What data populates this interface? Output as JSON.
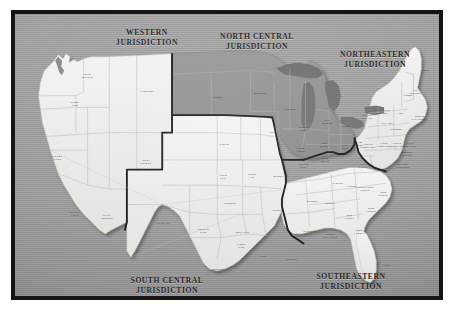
{
  "figure": {
    "kind": "printed-map-plate",
    "frame_color": "#141414",
    "paper_color": "#ffffff"
  },
  "palette": {
    "ocean_gray": "#9a9a9a",
    "land_light": "#ededeb",
    "land_gray": "#8f8f8f",
    "lake_gray": "#70706f",
    "state_line": "#b9b9b6",
    "jurisdiction_line": "#151515",
    "label_ink": "#26241f"
  },
  "jurisdictions": [
    {
      "id": "western",
      "line1": "Western",
      "line2": "Jurisdiction",
      "fill": "light"
    },
    {
      "id": "north-central",
      "line1": "North Central",
      "line2": "Jurisdiction",
      "fill": "gray"
    },
    {
      "id": "northeastern",
      "line1": "Northeastern",
      "line2": "Jurisdiction",
      "fill": "light"
    },
    {
      "id": "south-central",
      "line1": "South Central",
      "line2": "Jurisdiction",
      "fill": "light"
    },
    {
      "id": "southeastern",
      "line1": "Southeastern",
      "line2": "Jurisdiction",
      "fill": "light"
    }
  ],
  "conference_labels": [
    {
      "text": "Pacific\nNorthwest",
      "x": 72,
      "y": 62,
      "shade": "light"
    },
    {
      "text": "Oregon-\nIdaho",
      "x": 60,
      "y": 90,
      "shade": "light"
    },
    {
      "text": "Yellowstone",
      "x": 132,
      "y": 78,
      "shade": "light"
    },
    {
      "text": "Rocky\nMountain",
      "x": 131,
      "y": 148,
      "shade": "light"
    },
    {
      "text": "California-\nNevada",
      "x": 42,
      "y": 144,
      "shade": "light"
    },
    {
      "text": "California-\nPacific",
      "x": 60,
      "y": 200,
      "shade": "light"
    },
    {
      "text": "Desert\nSouthwest",
      "x": 92,
      "y": 203,
      "shade": "light"
    },
    {
      "text": "Dakotas",
      "x": 203,
      "y": 84,
      "shade": "gray"
    },
    {
      "text": "Minnesota",
      "x": 245,
      "y": 80,
      "shade": "gray"
    },
    {
      "text": "Wisconsin",
      "x": 275,
      "y": 96,
      "shade": "gray"
    },
    {
      "text": "Iowa",
      "x": 257,
      "y": 119,
      "shade": "gray"
    },
    {
      "text": "Northern\nIllinois",
      "x": 288,
      "y": 115,
      "shade": "gray"
    },
    {
      "text": "West\nMichigan",
      "x": 312,
      "y": 108,
      "shade": "gray"
    },
    {
      "text": "Detroit",
      "x": 331,
      "y": 113,
      "shade": "gray"
    },
    {
      "text": "North\nIndiana",
      "x": 309,
      "y": 131,
      "shade": "gray"
    },
    {
      "text": "South\nIndiana",
      "x": 310,
      "y": 146,
      "shade": "gray"
    },
    {
      "text": "Central\nIllinois",
      "x": 286,
      "y": 136,
      "shade": "gray"
    },
    {
      "text": "Southern\nIllinois",
      "x": 288,
      "y": 152,
      "shade": "gray"
    },
    {
      "text": "West\nOhio",
      "x": 330,
      "y": 133,
      "shade": "gray"
    },
    {
      "text": "East\nOhio",
      "x": 345,
      "y": 130,
      "shade": "gray"
    },
    {
      "text": "Nebraska",
      "x": 209,
      "y": 131,
      "shade": "light"
    },
    {
      "text": "Kansas\nWest",
      "x": 208,
      "y": 163,
      "shade": "light"
    },
    {
      "text": "Kansas\nEast",
      "x": 237,
      "y": 162,
      "shade": "light"
    },
    {
      "text": "Missouri",
      "x": 263,
      "y": 163,
      "shade": "light"
    },
    {
      "text": "Oklahoma",
      "x": 215,
      "y": 190,
      "shade": "light"
    },
    {
      "text": "Arkansas",
      "x": 262,
      "y": 197,
      "shade": "light"
    },
    {
      "text": "New Mexico",
      "x": 148,
      "y": 210,
      "shade": "light"
    },
    {
      "text": "Northwest\nTexas",
      "x": 188,
      "y": 217,
      "shade": "light"
    },
    {
      "text": "North Texas",
      "x": 227,
      "y": 219,
      "shade": "light"
    },
    {
      "text": "Central\nTexas",
      "x": 226,
      "y": 232,
      "shade": "light"
    },
    {
      "text": "Texas",
      "x": 248,
      "y": 243,
      "shade": "light"
    },
    {
      "text": "Southwest\nTexas",
      "x": 203,
      "y": 257,
      "shade": "light"
    },
    {
      "text": "Louisiana",
      "x": 276,
      "y": 246,
      "shade": "light"
    },
    {
      "text": "Mississippi",
      "x": 295,
      "y": 218,
      "shade": "light"
    },
    {
      "text": "Alabama-\nWest Florida",
      "x": 315,
      "y": 222,
      "shade": "light"
    },
    {
      "text": "Memphis",
      "x": 297,
      "y": 188,
      "shade": "light"
    },
    {
      "text": "Tennessee",
      "x": 315,
      "y": 190,
      "shade": "light"
    },
    {
      "text": "Holston",
      "x": 337,
      "y": 173,
      "shade": "light"
    },
    {
      "text": "Kentucky",
      "x": 323,
      "y": 170,
      "shade": "light"
    },
    {
      "text": "North\nGeorgia",
      "x": 334,
      "y": 203,
      "shade": "light"
    },
    {
      "text": "South\nGeorgia",
      "x": 344,
      "y": 218,
      "shade": "light"
    },
    {
      "text": "North\nCarolina",
      "x": 368,
      "y": 180,
      "shade": "light"
    },
    {
      "text": "Western North\nCarolina",
      "x": 350,
      "y": 175,
      "shade": "light"
    },
    {
      "text": "South\nCarolina",
      "x": 356,
      "y": 196,
      "shade": "light"
    },
    {
      "text": "Florida",
      "x": 372,
      "y": 252,
      "shade": "light"
    },
    {
      "text": "West\nVirginia",
      "x": 348,
      "y": 152,
      "shade": "light"
    },
    {
      "text": "Virginia",
      "x": 364,
      "y": 157,
      "shade": "light"
    },
    {
      "text": "Baltimore-\nWashington",
      "x": 388,
      "y": 152,
      "shade": "gray"
    },
    {
      "text": "Peninsula-\nDelaware",
      "x": 392,
      "y": 140,
      "shade": "gray"
    },
    {
      "text": "Eastern\nPennsylvania",
      "x": 382,
      "y": 131,
      "shade": "light"
    },
    {
      "text": "Central\nPennsylvania",
      "x": 369,
      "y": 131,
      "shade": "light"
    },
    {
      "text": "Western\nPennsylvania",
      "x": 353,
      "y": 132,
      "shade": "light"
    },
    {
      "text": "Greater\nNew Jersey",
      "x": 395,
      "y": 131,
      "shade": "light"
    },
    {
      "text": "New York",
      "x": 372,
      "y": 110,
      "shade": "light"
    },
    {
      "text": "Wyoming",
      "x": 381,
      "y": 116,
      "shade": "light"
    },
    {
      "text": "North Central\nNew York",
      "x": 367,
      "y": 98,
      "shade": "light"
    },
    {
      "text": "Troy",
      "x": 386,
      "y": 100,
      "shade": "light"
    },
    {
      "text": "Western\nNew York",
      "x": 352,
      "y": 103,
      "shade": "light"
    },
    {
      "text": "Maine",
      "x": 411,
      "y": 57,
      "shade": "gray"
    },
    {
      "text": "New\nHampshire",
      "x": 400,
      "y": 78,
      "shade": "light"
    },
    {
      "text": "Vermont",
      "x": 393,
      "y": 82,
      "shade": "light"
    },
    {
      "text": "Southern\nNew England",
      "x": 404,
      "y": 104,
      "shade": "light"
    }
  ]
}
